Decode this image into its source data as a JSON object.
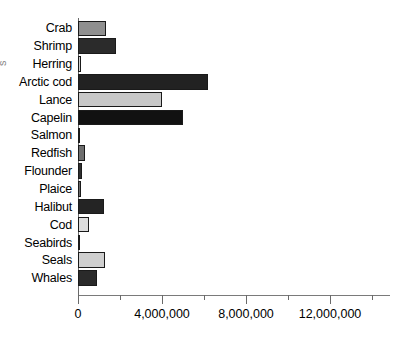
{
  "chart_data": {
    "type": "bar",
    "orientation": "horizontal",
    "title": "",
    "xlabel": "",
    "ylabel": "",
    "xlim": [
      0,
      14900000
    ],
    "grid": false,
    "legend": null,
    "axis": {
      "major_ticks": [
        0,
        4000000,
        8000000,
        12000000
      ],
      "major_tick_labels": [
        "0",
        "4,000,000",
        "8,000,000",
        "12,000,000"
      ],
      "minor_ticks": [
        2000000,
        6000000,
        10000000,
        14000000
      ],
      "px_per_unit": 2.1e-05,
      "origin_px": 78
    },
    "categories": [
      "Crab",
      "Shrimp",
      "Herring",
      "Arctic cod",
      "Lance",
      "Capelin",
      "Salmon",
      "Redfish",
      "Flounder",
      "Plaice",
      "Halibut",
      "Cod",
      "Seabirds",
      "Seals",
      "Whales"
    ],
    "values": [
      1330000,
      1800000,
      150000,
      6200000,
      4000000,
      5000000,
      100000,
      350000,
      200000,
      120000,
      1250000,
      500000,
      30000,
      1300000,
      900000
    ],
    "bar_colors": [
      "#8f8f8f",
      "#2b2b2b",
      "#d0d0d0",
      "#222222",
      "#c8c8c8",
      "#111111",
      "#b8b8b8",
      "#6e6e6e",
      "#2f2f2f",
      "#6a6a6a",
      "#242424",
      "#dcdcdc",
      "#9a9a9a",
      "#cfcfcf",
      "#2a2a2a"
    ]
  },
  "ylabel_fragment": {
    "text": "s"
  }
}
